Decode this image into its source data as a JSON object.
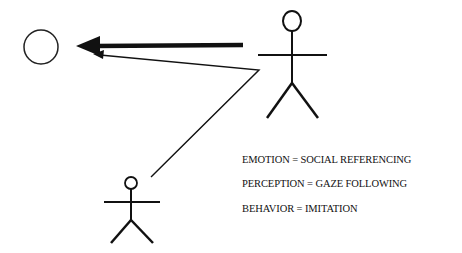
{
  "diagram": {
    "colors": {
      "ink": "#111111",
      "background": "#ffffff"
    },
    "nodes": [
      {
        "id": "object",
        "shape": "circle"
      },
      {
        "id": "adult",
        "shape": "stick-figure",
        "size": "large"
      },
      {
        "id": "child",
        "shape": "stick-figure",
        "size": "small"
      }
    ],
    "edges": [
      {
        "from": "adult",
        "to": "object",
        "style": "thick-arrow"
      },
      {
        "from": "child",
        "to": "object",
        "via": "adult",
        "style": "thin-arrow"
      }
    ]
  },
  "legend": {
    "lines": [
      "EMOTION = SOCIAL REFERENCING",
      "PERCEPTION = GAZE FOLLOWING",
      "BEHAVIOR = IMITATION"
    ]
  }
}
